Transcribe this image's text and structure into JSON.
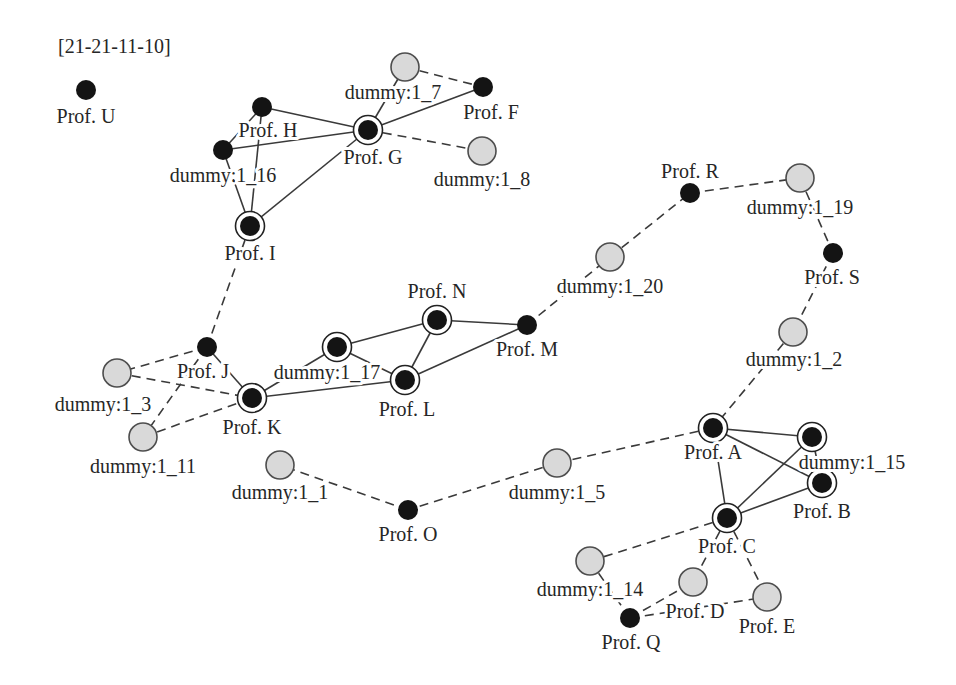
{
  "diagram": {
    "title": "[21-21-11-10]",
    "colors": {
      "node_black": "#141414",
      "ring_stroke": "#222222",
      "dummy_fill": "#d9d9d9",
      "dummy_stroke": "#4d4d4d",
      "edge": "#3a3a3a",
      "text": "#262626"
    },
    "node_types": {
      "solid": "black filled node",
      "ringed": "black filled node with outer ring",
      "dummy": "light gray node"
    },
    "nodes": [
      {
        "id": "U",
        "label": "Prof. U",
        "type": "solid",
        "x": 86,
        "y": 90,
        "lx": 86,
        "ly": 123
      },
      {
        "id": "H",
        "label": "Prof. H",
        "type": "solid",
        "x": 262,
        "y": 107,
        "lx": 268,
        "ly": 137
      },
      {
        "id": "D16",
        "label": "dummy:1_16",
        "type": "solid",
        "x": 223,
        "y": 150,
        "lx": 223,
        "ly": 182
      },
      {
        "id": "I",
        "label": "Prof. I",
        "type": "ringed",
        "x": 250,
        "y": 226,
        "lx": 250,
        "ly": 260
      },
      {
        "id": "D7",
        "label": "dummy:1_7",
        "type": "dummy",
        "x": 405,
        "y": 67,
        "lx": 393,
        "ly": 99
      },
      {
        "id": "F",
        "label": "Prof. F",
        "type": "solid",
        "x": 483,
        "y": 87,
        "lx": 491,
        "ly": 119
      },
      {
        "id": "G",
        "label": "Prof. G",
        "type": "ringed",
        "x": 368,
        "y": 130,
        "lx": 373,
        "ly": 164
      },
      {
        "id": "D8",
        "label": "dummy:1_8",
        "type": "dummy",
        "x": 482,
        "y": 151,
        "lx": 482,
        "ly": 186
      },
      {
        "id": "R",
        "label": "Prof. R",
        "type": "solid",
        "x": 690,
        "y": 193,
        "lx": 690,
        "ly": 178
      },
      {
        "id": "D19",
        "label": "dummy:1_19",
        "type": "dummy",
        "x": 800,
        "y": 178,
        "lx": 800,
        "ly": 214
      },
      {
        "id": "S",
        "label": "Prof. S",
        "type": "solid",
        "x": 833,
        "y": 253,
        "lx": 832,
        "ly": 284
      },
      {
        "id": "D20",
        "label": "dummy:1_20",
        "type": "dummy",
        "x": 610,
        "y": 257,
        "lx": 610,
        "ly": 293
      },
      {
        "id": "D2",
        "label": "dummy:1_2",
        "type": "dummy",
        "x": 793,
        "y": 332,
        "lx": 794,
        "ly": 366
      },
      {
        "id": "N",
        "label": "Prof. N",
        "type": "ringed",
        "x": 437,
        "y": 320,
        "lx": 437,
        "ly": 298
      },
      {
        "id": "M",
        "label": "Prof. M",
        "type": "solid",
        "x": 527,
        "y": 325,
        "lx": 527,
        "ly": 356
      },
      {
        "id": "D17",
        "label": "dummy:1_17",
        "type": "ringed",
        "x": 337,
        "y": 347,
        "lx": 327,
        "ly": 379
      },
      {
        "id": "L",
        "label": "Prof. L",
        "type": "ringed",
        "x": 405,
        "y": 380,
        "lx": 407,
        "ly": 416
      },
      {
        "id": "J",
        "label": "Prof. J",
        "type": "solid",
        "x": 207,
        "y": 347,
        "lx": 203,
        "ly": 378
      },
      {
        "id": "D3",
        "label": "dummy:1_3",
        "type": "dummy",
        "x": 117,
        "y": 373,
        "lx": 103,
        "ly": 411
      },
      {
        "id": "K",
        "label": "Prof. K",
        "type": "ringed",
        "x": 252,
        "y": 398,
        "lx": 252,
        "ly": 434
      },
      {
        "id": "D11",
        "label": "dummy:1_11",
        "type": "dummy",
        "x": 143,
        "y": 437,
        "lx": 143,
        "ly": 473
      },
      {
        "id": "D1",
        "label": "dummy:1_1",
        "type": "dummy",
        "x": 280,
        "y": 465,
        "lx": 280,
        "ly": 499
      },
      {
        "id": "O",
        "label": "Prof. O",
        "type": "solid",
        "x": 408,
        "y": 510,
        "lx": 408,
        "ly": 541
      },
      {
        "id": "D5",
        "label": "dummy:1_5",
        "type": "dummy",
        "x": 557,
        "y": 463,
        "lx": 557,
        "ly": 499
      },
      {
        "id": "A",
        "label": "Prof. A",
        "type": "ringed",
        "x": 713,
        "y": 428,
        "lx": 713,
        "ly": 459
      },
      {
        "id": "D15",
        "label": "dummy:1_15",
        "type": "ringed",
        "x": 812,
        "y": 437,
        "lx": 852,
        "ly": 469
      },
      {
        "id": "B",
        "label": "Prof. B",
        "type": "ringed",
        "x": 822,
        "y": 483,
        "lx": 822,
        "ly": 518
      },
      {
        "id": "C",
        "label": "Prof. C",
        "type": "ringed",
        "x": 727,
        "y": 518,
        "lx": 727,
        "ly": 553
      },
      {
        "id": "D14",
        "label": "dummy:1_14",
        "type": "dummy",
        "x": 590,
        "y": 561,
        "lx": 590,
        "ly": 596
      },
      {
        "id": "D",
        "label": "Prof. D",
        "type": "dummy",
        "x": 693,
        "y": 582,
        "lx": 695,
        "ly": 618
      },
      {
        "id": "E",
        "label": "Prof. E",
        "type": "dummy",
        "x": 767,
        "y": 597,
        "lx": 767,
        "ly": 633
      },
      {
        "id": "Q",
        "label": "Prof. Q",
        "type": "solid",
        "x": 630,
        "y": 618,
        "lx": 631,
        "ly": 649
      }
    ],
    "edges": [
      {
        "from": "H",
        "to": "G",
        "style": "solid"
      },
      {
        "from": "D16",
        "to": "G",
        "style": "solid"
      },
      {
        "from": "I",
        "to": "G",
        "style": "solid"
      },
      {
        "from": "H",
        "to": "D16",
        "style": "solid"
      },
      {
        "from": "H",
        "to": "I",
        "style": "solid"
      },
      {
        "from": "D16",
        "to": "I",
        "style": "solid"
      },
      {
        "from": "D7",
        "to": "G",
        "style": "solid"
      },
      {
        "from": "G",
        "to": "F",
        "style": "solid"
      },
      {
        "from": "D7",
        "to": "F",
        "style": "dashed"
      },
      {
        "from": "G",
        "to": "D8",
        "style": "dashed"
      },
      {
        "from": "I",
        "to": "J",
        "style": "dashed"
      },
      {
        "from": "J",
        "to": "D3",
        "style": "dashed"
      },
      {
        "from": "J",
        "to": "D11",
        "style": "dashed"
      },
      {
        "from": "D3",
        "to": "K",
        "style": "dashed"
      },
      {
        "from": "D11",
        "to": "K",
        "style": "dashed"
      },
      {
        "from": "J",
        "to": "K",
        "style": "solid"
      },
      {
        "from": "D17",
        "to": "K",
        "style": "solid"
      },
      {
        "from": "K",
        "to": "L",
        "style": "solid"
      },
      {
        "from": "D17",
        "to": "N",
        "style": "solid"
      },
      {
        "from": "D17",
        "to": "L",
        "style": "solid"
      },
      {
        "from": "N",
        "to": "L",
        "style": "solid"
      },
      {
        "from": "N",
        "to": "M",
        "style": "solid"
      },
      {
        "from": "L",
        "to": "M",
        "style": "solid"
      },
      {
        "from": "M",
        "to": "D20",
        "style": "dashed"
      },
      {
        "from": "D20",
        "to": "R",
        "style": "dashed"
      },
      {
        "from": "R",
        "to": "D19",
        "style": "dashed"
      },
      {
        "from": "D19",
        "to": "S",
        "style": "dashed"
      },
      {
        "from": "S",
        "to": "D2",
        "style": "dashed"
      },
      {
        "from": "D2",
        "to": "A",
        "style": "dashed"
      },
      {
        "from": "A",
        "to": "D5",
        "style": "dashed"
      },
      {
        "from": "D5",
        "to": "O",
        "style": "dashed"
      },
      {
        "from": "O",
        "to": "D1",
        "style": "dashed"
      },
      {
        "from": "A",
        "to": "D15",
        "style": "solid"
      },
      {
        "from": "A",
        "to": "B",
        "style": "solid"
      },
      {
        "from": "A",
        "to": "C",
        "style": "solid"
      },
      {
        "from": "D15",
        "to": "C",
        "style": "solid"
      },
      {
        "from": "B",
        "to": "C",
        "style": "solid"
      },
      {
        "from": "D15",
        "to": "B",
        "style": "solid"
      },
      {
        "from": "C",
        "to": "D14",
        "style": "dashed"
      },
      {
        "from": "C",
        "to": "D",
        "style": "dashed"
      },
      {
        "from": "C",
        "to": "E",
        "style": "dashed"
      },
      {
        "from": "D14",
        "to": "Q",
        "style": "dashed"
      },
      {
        "from": "Q",
        "to": "D",
        "style": "dashed"
      },
      {
        "from": "Q",
        "to": "E",
        "style": "dashed"
      }
    ]
  }
}
